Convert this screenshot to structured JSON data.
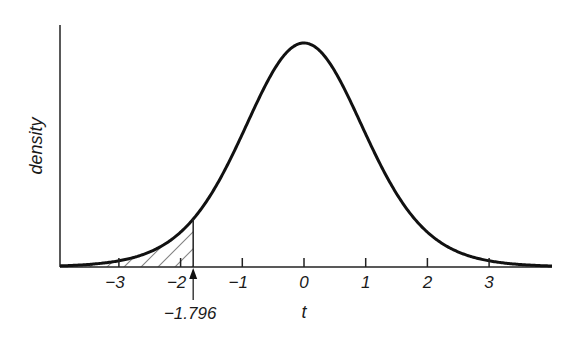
{
  "chart_data": {
    "type": "area",
    "title": "",
    "xlabel": "t",
    "ylabel": "density",
    "distribution": "Student t (bell-shaped density curve)",
    "xlim": [
      -4.0,
      4.0
    ],
    "x_ticks": [
      -3,
      -2,
      -1,
      0,
      1,
      2,
      3
    ],
    "x_tick_labels": [
      "−3",
      "−2",
      "−1",
      "0",
      "1",
      "2",
      "3"
    ],
    "y_ticks": [],
    "grid": false,
    "legend": null,
    "shaded_region": {
      "from": "-inf",
      "to": -1.796,
      "style": "diagonal hatch",
      "meaning": "lower-tail probability"
    },
    "annotations": [
      {
        "text": "−1.796",
        "x": -1.796,
        "type": "arrow pointing up to axis"
      }
    ],
    "curve_points": {
      "x": [
        -4,
        -3,
        -2,
        -1.796,
        -1,
        0,
        1,
        2,
        3,
        4
      ],
      "relative_density": [
        0.01,
        0.03,
        0.16,
        0.21,
        0.59,
        1.0,
        0.59,
        0.16,
        0.03,
        0.01
      ]
    }
  },
  "labels": {
    "ylabel": "density",
    "xlabel": "t",
    "critical_value": "−1.796",
    "ticks": [
      "−3",
      "−2",
      "−1",
      "0",
      "1",
      "2",
      "3"
    ]
  }
}
